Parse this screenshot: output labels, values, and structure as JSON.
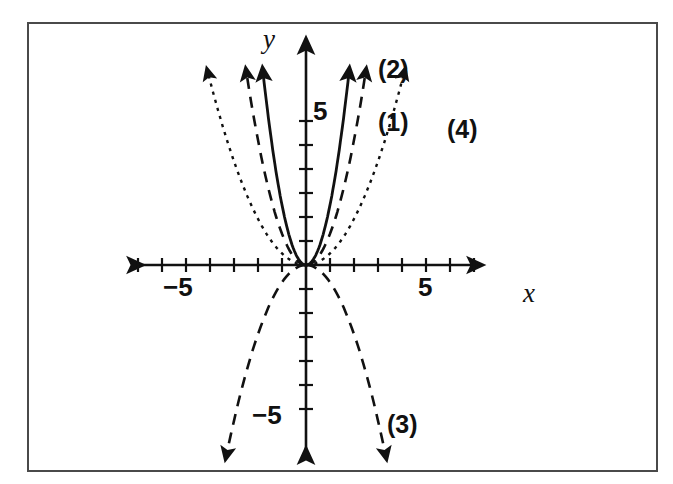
{
  "figure": {
    "background_color": "#ffffff",
    "border_color": "#4a4a4a",
    "ink_color": "#111111"
  },
  "axis_labels": {
    "x": "x",
    "y": "y"
  },
  "tick_labels": {
    "x_negative": "−5",
    "x_positive": "5",
    "y_positive": "5",
    "y_negative": "−5"
  },
  "curve_labels": {
    "c1": "(1)",
    "c2": "(2)",
    "c3": "(3)",
    "c4": "(4)"
  },
  "chart_data": {
    "type": "line",
    "title": "",
    "xlabel": "x",
    "ylabel": "y",
    "xlim": [
      -7.5,
      8.5
    ],
    "ylim": [
      -8.0,
      8.5
    ],
    "grid": false,
    "legend_position": "inline-curve-labels",
    "axis_style": "double-arrow-cartesian",
    "x_ticks": [
      -7,
      -6,
      -5,
      -4,
      -3,
      -2,
      -1,
      1,
      2,
      3,
      4,
      5,
      6,
      7
    ],
    "y_ticks": [
      -5,
      -4,
      -3,
      -2,
      -1,
      1,
      2,
      3,
      4,
      5,
      6
    ],
    "x_tick_labels_shown": [
      -5,
      5
    ],
    "y_tick_labels_shown": [
      5,
      -5
    ],
    "tick_spacing_px": 24,
    "origin_px": [
      306,
      265
    ],
    "series": [
      {
        "name": "(1)",
        "label": "(1)",
        "equation": "y = 2.5 x^2",
        "coefficient": 2.5,
        "opens": "up",
        "linestyle": "solid",
        "vertex": [
          0,
          0
        ],
        "x": [
          -1.75,
          -1.5,
          -1.25,
          -1.0,
          -0.75,
          -0.5,
          -0.25,
          0,
          0.25,
          0.5,
          0.75,
          1.0,
          1.25,
          1.5,
          1.75
        ],
        "y": [
          7.66,
          5.63,
          3.91,
          2.5,
          1.41,
          0.63,
          0.16,
          0,
          0.16,
          0.63,
          1.41,
          2.5,
          3.91,
          5.63,
          7.66
        ]
      },
      {
        "name": "(2)",
        "label": "(2)",
        "equation": "y = 1.3 x^2",
        "coefficient": 1.3,
        "opens": "up",
        "linestyle": "dashed",
        "vertex": [
          0,
          0
        ],
        "x": [
          -2.5,
          -2.0,
          -1.5,
          -1.0,
          -0.5,
          0,
          0.5,
          1.0,
          1.5,
          2.0,
          2.5
        ],
        "y": [
          8.13,
          5.2,
          2.93,
          1.3,
          0.33,
          0,
          0.33,
          1.3,
          2.93,
          5.2,
          8.13
        ]
      },
      {
        "name": "(3)",
        "label": "(3)",
        "equation": "y = -0.72 x^2",
        "coefficient": -0.72,
        "opens": "down",
        "linestyle": "dashed",
        "vertex": [
          0,
          0
        ],
        "x": [
          -3.2,
          -2.5,
          -2.0,
          -1.5,
          -1.0,
          -0.5,
          0,
          0.5,
          1.0,
          1.5,
          2.0,
          2.5,
          3.2
        ],
        "y": [
          -7.37,
          -4.5,
          -2.88,
          -1.62,
          -0.72,
          -0.18,
          0,
          -0.18,
          -0.72,
          -1.62,
          -2.88,
          -4.5,
          -7.37
        ]
      },
      {
        "name": "(4)",
        "label": "(4)",
        "equation": "y = 0.48 x^2",
        "coefficient": 0.48,
        "opens": "up",
        "linestyle": "dotted",
        "vertex": [
          0,
          0
        ],
        "x": [
          -6.3,
          -5.0,
          -4.0,
          -3.0,
          -2.0,
          -1.0,
          0,
          1.0,
          2.0,
          3.0,
          4.0,
          5.0,
          6.3
        ],
        "y": [
          19.05,
          12.0,
          7.68,
          4.32,
          1.92,
          0.48,
          0,
          0.48,
          1.92,
          4.32,
          7.68,
          12.0,
          19.05
        ]
      }
    ]
  }
}
